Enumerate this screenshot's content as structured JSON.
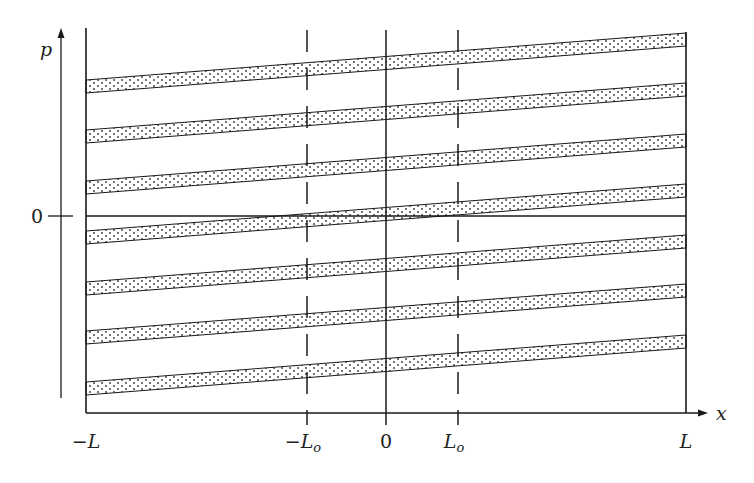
{
  "figure": {
    "axes": {
      "x_label": "x",
      "y_label": "p",
      "y_zero_label": "0"
    },
    "x_ticks": [
      {
        "label": "−L",
        "pos": 86
      },
      {
        "label": "−L",
        "sub": "o",
        "pos": 307
      },
      {
        "label": "0",
        "pos": 386
      },
      {
        "label": "L",
        "sub": "o",
        "pos": 458
      },
      {
        "label": "L",
        "pos": 686
      }
    ],
    "vertical_lines": [
      {
        "name": "left-boundary",
        "x": 86,
        "style": "solid"
      },
      {
        "name": "minus-L0",
        "x": 307,
        "style": "dashed"
      },
      {
        "name": "center",
        "x": 386,
        "style": "solid"
      },
      {
        "name": "plus-L0",
        "x": 458,
        "style": "dashed"
      },
      {
        "name": "right-boundary",
        "x": 686,
        "style": "solid"
      }
    ],
    "bands": {
      "count": 7,
      "left_top_y": [
        80,
        130,
        181,
        231,
        282,
        331,
        382
      ],
      "thickness": 13,
      "rise": 47,
      "fill": "dotted"
    },
    "zero_line_y": 216,
    "colors": {
      "ink": "#1a1a1a",
      "band_dot": "#333333",
      "background": "#ffffff"
    }
  }
}
